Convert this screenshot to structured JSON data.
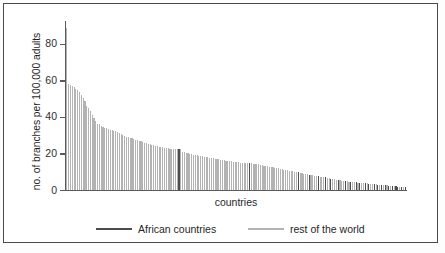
{
  "chart_data": {
    "type": "bar",
    "title": "",
    "subtitle": "",
    "xlabel": "countries",
    "ylabel": "no. of branches per 100,000 adults",
    "ylim": [
      0,
      92
    ],
    "yticks": [
      0,
      20,
      40,
      60,
      80
    ],
    "ytick_labels": [
      "0",
      "20",
      "40",
      "60",
      "80"
    ],
    "xticks": [],
    "xtick_labels": [],
    "grid": false,
    "legend_position": "below-axes",
    "sorted": "descending",
    "bar_count": 188,
    "categories_note": "countries sorted in descending order of branch density; individual country names are not labelled on the axis",
    "legend": [
      {
        "name": "African countries",
        "color": "#4d4d4d"
      },
      {
        "name": "rest of the world",
        "color": "#b3b3b3"
      }
    ],
    "series": [
      {
        "name": "no. of branches per 100,000 adults",
        "values": [
          88.5,
          57.8,
          57.4,
          56.9,
          56.2,
          55.4,
          54.6,
          53.8,
          52.2,
          50.4,
          48.6,
          46.2,
          44.9,
          43.4,
          41.1,
          39.2,
          37.6,
          36.4,
          35.9,
          35.2,
          34.6,
          34.2,
          33.8,
          33.4,
          33.0,
          32.7,
          32.4,
          32.1,
          31.7,
          31.2,
          30.6,
          30.1,
          29.5,
          29.2,
          29.0,
          28.7,
          28.4,
          28.0,
          27.6,
          27.2,
          26.9,
          26.6,
          26.3,
          26.0,
          25.7,
          25.4,
          25.1,
          24.8,
          24.5,
          24.2,
          24.0,
          23.8,
          23.6,
          23.4,
          23.2,
          23.0,
          22.8,
          22.6,
          22.5,
          22.4,
          22.3,
          22.2,
          22.4,
          22.3,
          21.0,
          20.6,
          20.3,
          20.0,
          19.8,
          19.6,
          19.4,
          19.2,
          19.0,
          18.8,
          18.6,
          18.4,
          18.2,
          18.0,
          17.9,
          17.7,
          17.5,
          17.3,
          17.1,
          17.0,
          16.8,
          16.6,
          16.5,
          16.3,
          16.1,
          16.0,
          15.8,
          15.7,
          15.5,
          15.4,
          15.2,
          15.1,
          15.0,
          15.0,
          14.9,
          14.8,
          14.8,
          14.9,
          14.7,
          14.5,
          14.4,
          14.2,
          14.0,
          13.8,
          13.6,
          13.4,
          13.2,
          13.0,
          12.8,
          12.6,
          12.4,
          12.2,
          12.0,
          11.8,
          11.6,
          11.4,
          11.2,
          11.0,
          10.8,
          10.6,
          10.4,
          10.2,
          10.0,
          9.8,
          9.6,
          9.4,
          9.2,
          9.0,
          8.8,
          8.6,
          8.4,
          8.2,
          8.0,
          7.8,
          7.6,
          7.5,
          7.4,
          7.3,
          7.1,
          6.9,
          6.7,
          6.5,
          6.3,
          6.1,
          5.9,
          5.7,
          5.5,
          5.3,
          5.1,
          4.9,
          4.8,
          4.7,
          4.6,
          4.5,
          4.4,
          4.3,
          4.2,
          4.1,
          4.0,
          3.9,
          3.8,
          3.7,
          3.6,
          3.5,
          3.4,
          3.3,
          3.2,
          3.1,
          3.0,
          2.9,
          2.8,
          2.7,
          2.6,
          2.5,
          2.4,
          2.3,
          2.2,
          2.1,
          2.0,
          1.9,
          1.8,
          1.7,
          1.6,
          1.5
        ],
        "group_flags": [
          0,
          0,
          0,
          0,
          0,
          0,
          0,
          0,
          0,
          0,
          0,
          0,
          0,
          0,
          0,
          0,
          0,
          0,
          0,
          0,
          0,
          0,
          0,
          0,
          0,
          0,
          0,
          0,
          0,
          0,
          0,
          0,
          0,
          0,
          0,
          0,
          0,
          0,
          0,
          0,
          0,
          0,
          0,
          0,
          0,
          0,
          0,
          0,
          0,
          0,
          0,
          0,
          0,
          0,
          0,
          0,
          0,
          0,
          0,
          0,
          0,
          0,
          1,
          0,
          0,
          0,
          0,
          0,
          0,
          0,
          0,
          0,
          0,
          0,
          0,
          0,
          0,
          0,
          0,
          0,
          0,
          0,
          0,
          0,
          0,
          0,
          0,
          0,
          0,
          0,
          0,
          0,
          0,
          0,
          0,
          0,
          0,
          0,
          0,
          0,
          0,
          1,
          0,
          0,
          0,
          0,
          0,
          0,
          0,
          0,
          0,
          0,
          0,
          0,
          0,
          0,
          0,
          0,
          0,
          0,
          0,
          0,
          0,
          0,
          0,
          0,
          0,
          0,
          1,
          0,
          0,
          0,
          0,
          0,
          1,
          0,
          0,
          0,
          0,
          1,
          0,
          0,
          0,
          1,
          0,
          0,
          1,
          0,
          0,
          0,
          1,
          0,
          0,
          0,
          1,
          0,
          0,
          1,
          0,
          0,
          1,
          0,
          1,
          0,
          0,
          1,
          0,
          1,
          0,
          0,
          1,
          0,
          1,
          0,
          1,
          0,
          1,
          0,
          1,
          0,
          1,
          0,
          1,
          1,
          0,
          1,
          0,
          1
        ]
      }
    ],
    "colors": {
      "african": "#4d4d4d",
      "rest_of_world": "#b3b3b3",
      "axis": "#5b5b5b",
      "text": "#1f1f1f",
      "border": "#4a4a4a",
      "background": "#ffffff"
    }
  }
}
